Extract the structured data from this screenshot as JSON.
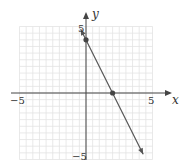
{
  "chart_data": {
    "type": "line",
    "title": "",
    "xlabel": "x",
    "ylabel": "y",
    "xlim": [
      -5,
      5
    ],
    "ylim": [
      -5,
      5
    ],
    "grid": true,
    "x_ticks_labeled": [
      "-5",
      "5"
    ],
    "y_ticks_labeled": [
      "5",
      "-5"
    ],
    "series": [
      {
        "name": "y = -2x + 4",
        "x": [
          -0.4,
          4.3
        ],
        "y": [
          4.8,
          -4.6
        ],
        "arrows_both_ends": true
      }
    ],
    "points": [
      {
        "x": 0,
        "y": 4,
        "label": "y-intercept"
      },
      {
        "x": 2,
        "y": 0,
        "label": "x-intercept"
      }
    ]
  },
  "labels": {
    "x_axis": "x",
    "y_axis": "y",
    "x_min": "−5",
    "x_max": "5",
    "y_max": "5",
    "y_min": "−5"
  }
}
